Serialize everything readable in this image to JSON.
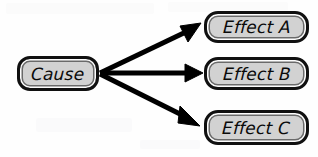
{
  "diagram": {
    "type": "cause-effect-fan",
    "background_color": "#fefefe",
    "node_fill_color": "#d2d2d2",
    "node_border_color": "#101010",
    "arrow_color": "#000000",
    "cause": {
      "id": "cause",
      "label": "Cause"
    },
    "effects": [
      {
        "id": "effect-a",
        "label": "Effect A"
      },
      {
        "id": "effect-b",
        "label": "Effect B"
      },
      {
        "id": "effect-c",
        "label": "Effect C"
      }
    ],
    "connectors": [
      {
        "id": "arrow-cause-to-effect-a",
        "from": "Cause",
        "to": "Effect A",
        "style": "solid-thick-arrow"
      },
      {
        "id": "arrow-cause-to-effect-b",
        "from": "Cause",
        "to": "Effect B",
        "style": "solid-thick-arrow"
      },
      {
        "id": "arrow-cause-to-effect-c",
        "from": "Cause",
        "to": "Effect C",
        "style": "solid-thick-arrow"
      }
    ]
  }
}
